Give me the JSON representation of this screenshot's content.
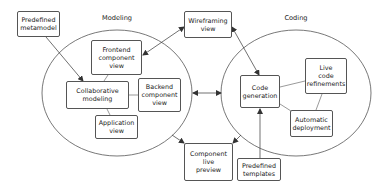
{
  "regions": {
    "modeling": {
      "label": "Modeling"
    },
    "coding": {
      "label": "Coding"
    }
  },
  "nodes": {
    "predefined_metamodel": "Predefined\nmetamodel",
    "wireframing_view": "Wireframing\nview",
    "frontend_component_view": "Frontend\ncomponent\nview",
    "collaborative_modeling": "Collaborative\nmodeling",
    "backend_component_view": "Backend\ncomponent\nview",
    "application_view": "Application\nview",
    "code_generation": "Code\ngeneration",
    "live_code_refinements": "Live\ncode\nrefinements",
    "automatic_deployment": "Automatic\ndeployment",
    "component_live_preview": "Component\nlive\npreview",
    "predefined_templates": "Predefined\ntemplates"
  },
  "colors": {
    "stroke": "#555555",
    "background": "#ffffff",
    "text": "#222222"
  }
}
